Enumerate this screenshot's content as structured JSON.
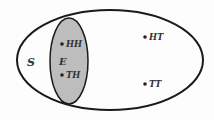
{
  "diagram": {
    "type": "venn",
    "sample_space": {
      "label": "S"
    },
    "event": {
      "label": "E",
      "fill": "#bdbdbd"
    },
    "outcomes": [
      {
        "label": "HH",
        "in_event": true
      },
      {
        "label": "TH",
        "in_event": true
      },
      {
        "label": "HT",
        "in_event": false
      },
      {
        "label": "TT",
        "in_event": false
      }
    ]
  }
}
